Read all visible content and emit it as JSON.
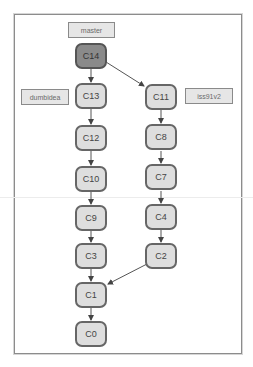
{
  "diagram": {
    "type": "git-commit-graph",
    "branches": [
      {
        "id": "master",
        "label": "master",
        "points_to": "C14"
      },
      {
        "id": "dumbidea",
        "label": "dumbidea",
        "points_to": "C13"
      },
      {
        "id": "iss91v2",
        "label": "iss91v2",
        "points_to": "C11"
      }
    ],
    "commits": [
      {
        "id": "C14",
        "label": "C14",
        "head": true
      },
      {
        "id": "C13",
        "label": "C13"
      },
      {
        "id": "C12",
        "label": "C12"
      },
      {
        "id": "C10",
        "label": "C10"
      },
      {
        "id": "C9",
        "label": "C9"
      },
      {
        "id": "C3",
        "label": "C3"
      },
      {
        "id": "C1",
        "label": "C1"
      },
      {
        "id": "C0",
        "label": "C0"
      },
      {
        "id": "C11",
        "label": "C11"
      },
      {
        "id": "C8",
        "label": "C8"
      },
      {
        "id": "C7",
        "label": "C7"
      },
      {
        "id": "C4",
        "label": "C4"
      },
      {
        "id": "C2",
        "label": "C2"
      }
    ],
    "edges": [
      [
        "C14",
        "C13"
      ],
      [
        "C14",
        "C11"
      ],
      [
        "C13",
        "C12"
      ],
      [
        "C12",
        "C10"
      ],
      [
        "C10",
        "C9"
      ],
      [
        "C9",
        "C3"
      ],
      [
        "C3",
        "C1"
      ],
      [
        "C1",
        "C0"
      ],
      [
        "C11",
        "C8"
      ],
      [
        "C8",
        "C7"
      ],
      [
        "C7",
        "C4"
      ],
      [
        "C4",
        "C2"
      ],
      [
        "C2",
        "C1"
      ]
    ],
    "colors": {
      "head_fill": "#8a8a8a",
      "node_fill": "#dedede",
      "node_border": "#666666",
      "label_fill": "#e6e6e6",
      "label_border": "#8a8a8a",
      "edge": "#555555"
    }
  }
}
